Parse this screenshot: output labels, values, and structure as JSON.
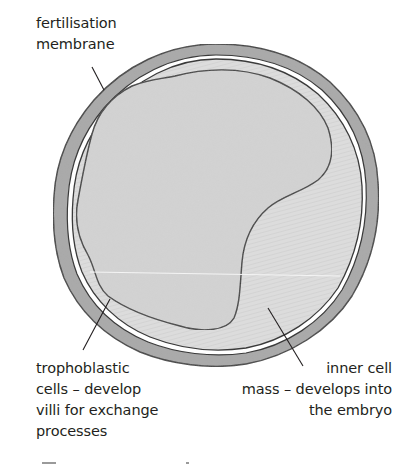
{
  "diagram": {
    "labels": {
      "fertilisation_membrane": "fertilisation\nmembrane",
      "trophoblastic_cells": "trophoblastic\ncells – develop\nvilli for exchange\nprocesses",
      "inner_cell_mass": "inner cell\nmass – develops into\nthe embryo"
    },
    "colors": {
      "membrane_fill": "#a6a6a6",
      "outline": "#3a3a3a",
      "gap": "#ffffff",
      "trophoblast_fill": "#d9d9d9",
      "inner_mass_fill": "#d2d2d2",
      "text": "#231f20"
    }
  }
}
